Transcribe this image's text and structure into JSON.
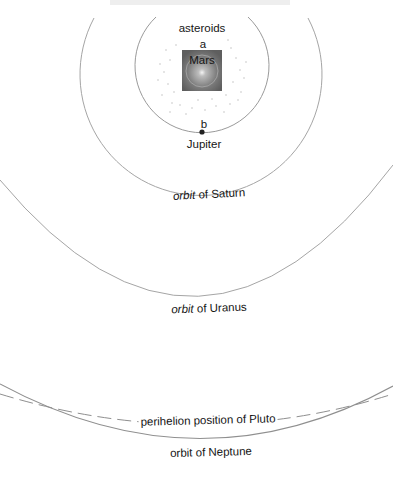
{
  "diagram": {
    "labels": {
      "asteroids": "asteroids",
      "point_a": "a",
      "mars": "Mars",
      "point_b": "b",
      "jupiter": "Jupiter",
      "saturn_orbit_prefix": "orbit",
      "saturn_orbit_suffix": " of Saturn",
      "uranus_orbit_prefix": "orbit",
      "uranus_orbit_suffix": " of Uranus",
      "pluto": "perihelion position of Pluto",
      "neptune_orbit": "orbit of Neptune"
    },
    "colors": {
      "orbit_line": "#9a9a9a",
      "mars_box": "#6e6e6e",
      "background": "#ffffff"
    }
  }
}
